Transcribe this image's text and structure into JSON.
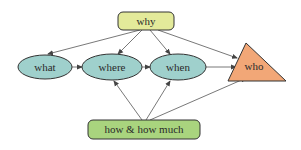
{
  "diagram": {
    "nodes": {
      "why": {
        "label": "why",
        "shape": "rounded-rect",
        "fill": "#e3ea9a"
      },
      "what": {
        "label": "what",
        "shape": "ellipse",
        "fill": "#9fd0cc"
      },
      "where": {
        "label": "where",
        "shape": "ellipse",
        "fill": "#9fd0cc"
      },
      "when": {
        "label": "when",
        "shape": "ellipse",
        "fill": "#9fd0cc"
      },
      "who": {
        "label": "who",
        "shape": "triangle",
        "fill": "#f2a777"
      },
      "how": {
        "label": "how & how much",
        "shape": "rounded-rect",
        "fill": "#a9d47e"
      }
    },
    "edges": [
      {
        "from": "why",
        "to": "what"
      },
      {
        "from": "why",
        "to": "where"
      },
      {
        "from": "why",
        "to": "when"
      },
      {
        "from": "why",
        "to": "who"
      },
      {
        "from": "what",
        "to": "where"
      },
      {
        "from": "where",
        "to": "when"
      },
      {
        "from": "when",
        "to": "who"
      },
      {
        "from": "how",
        "to": "where"
      },
      {
        "from": "how",
        "to": "when"
      },
      {
        "from": "how",
        "to": "who"
      }
    ]
  }
}
